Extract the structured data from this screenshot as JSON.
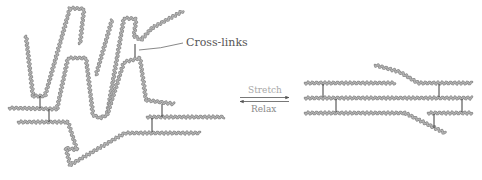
{
  "figure": {
    "labels": {
      "crosslinks": "Cross-links",
      "stretch": "Stretch",
      "relax": "Relax"
    },
    "colors": {
      "background": "#ffffff",
      "chain": "#8a8a8a",
      "crosslink": "#3a3a3a",
      "label_text": "#555555",
      "stretch_text": "#a8a8a8",
      "relax_text": "#8a8a8a",
      "arrow": "#555555"
    },
    "panels": [
      {
        "name": "relaxed-network",
        "description": "Coiled, tangled polymer chains joined by cross-links"
      },
      {
        "name": "stretched-network",
        "description": "Aligned, extended polymer chains joined by cross-links"
      }
    ],
    "arrows": [
      {
        "direction": "right",
        "label": "Stretch"
      },
      {
        "direction": "left",
        "label": "Relax"
      }
    ]
  }
}
